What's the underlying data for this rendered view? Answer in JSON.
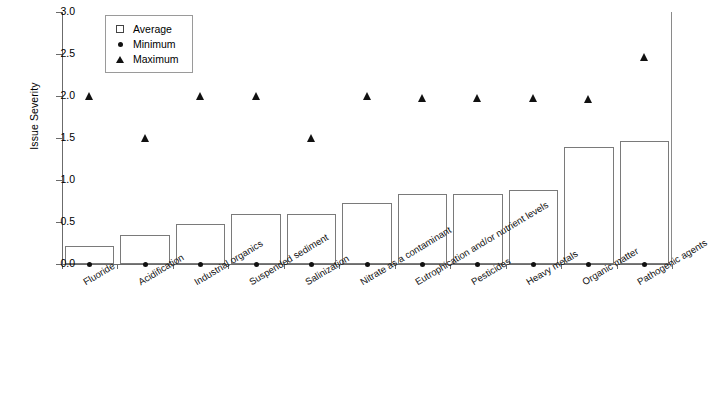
{
  "chart_data": {
    "type": "bar",
    "title": "",
    "xlabel": "",
    "ylabel": "Issue Severity",
    "ylim": [
      0.0,
      3.0
    ],
    "ytick_values": [
      0.0,
      0.5,
      1.0,
      1.5,
      2.0,
      2.5,
      3.0
    ],
    "ytick_labels": [
      "0.0",
      "0.5",
      "1.0",
      "1.5",
      "2.0",
      "2.5",
      "3.0"
    ],
    "grid": false,
    "legend_position": "top-left-inside",
    "categories": [
      "Fluoride",
      "Acidification",
      "Industrial organics",
      "Suspended sediment",
      "Salinization",
      "Nitrate as a contaminant",
      "Eutrophication and/or nutrient levels",
      "Pesticides",
      "Heavy metals",
      "Organic matter",
      "Pathogenic agents"
    ],
    "series": [
      {
        "name": "Average",
        "marker": "open-square",
        "render": "bar",
        "values": [
          0.21,
          0.35,
          0.48,
          0.6,
          0.59,
          0.73,
          0.83,
          0.83,
          0.88,
          1.39,
          1.47
        ]
      },
      {
        "name": "Minimum",
        "marker": "filled-circle",
        "render": "point",
        "values": [
          0.0,
          0.0,
          0.0,
          0.0,
          0.0,
          0.0,
          0.0,
          0.0,
          0.0,
          0.0,
          0.0
        ]
      },
      {
        "name": "Maximum",
        "marker": "filled-triangle",
        "render": "point",
        "values": [
          2.0,
          1.5,
          2.0,
          2.0,
          1.5,
          2.0,
          1.98,
          1.98,
          1.98,
          1.97,
          2.47
        ]
      }
    ]
  },
  "legend": {
    "entries": [
      {
        "label": "Average",
        "marker": "open-square"
      },
      {
        "label": "Minimum",
        "marker": "filled-circle"
      },
      {
        "label": "Maximum",
        "marker": "filled-triangle"
      }
    ]
  },
  "colors": {
    "bar_stroke": "#7a7a7a",
    "marker_fill": "#111111",
    "axis": "#6b6b6b",
    "background": "#ffffff"
  }
}
